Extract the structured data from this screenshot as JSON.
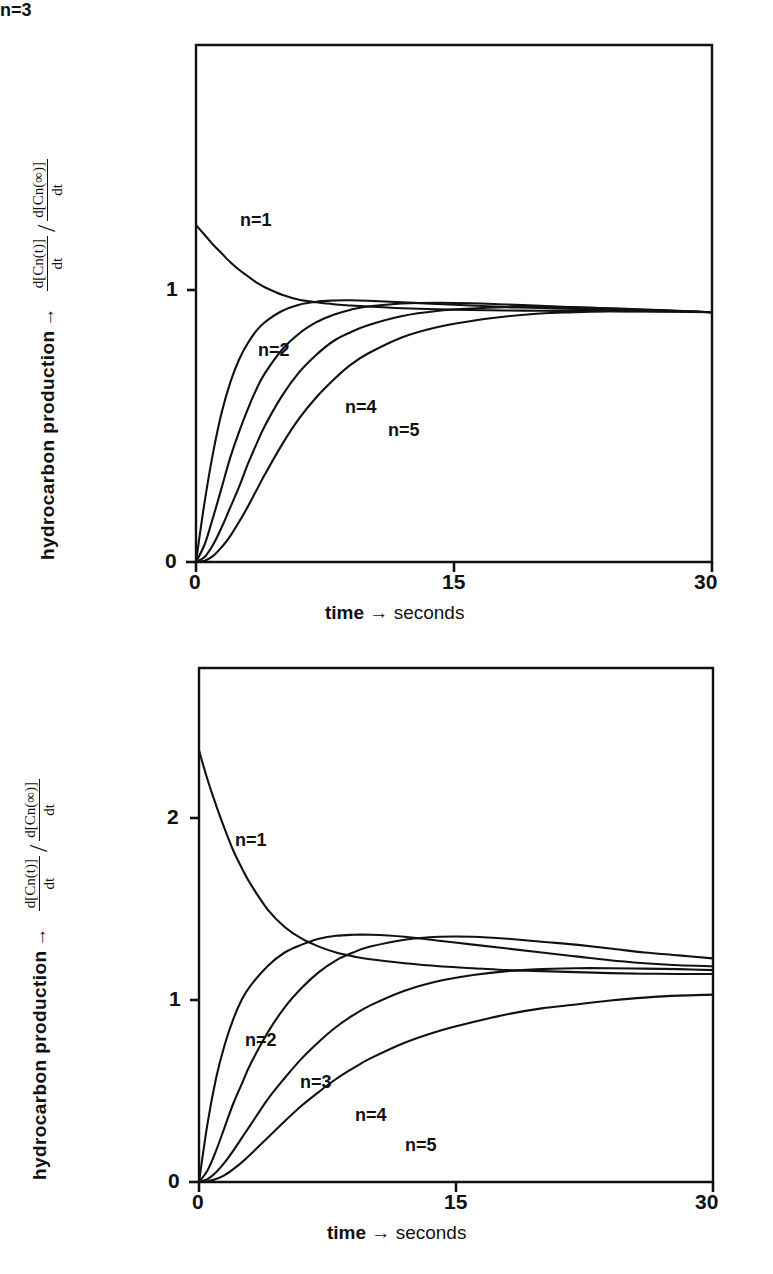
{
  "page": {
    "header_faint_text": "",
    "footer_faint_text": ""
  },
  "figures": [
    {
      "id": "top",
      "ylabel_main": "hydrocarbon production",
      "ylabel_arrow": "→",
      "ratio": {
        "numerator_top": "d[Cn(t)]",
        "numerator_bottom": "dt",
        "divider": "/",
        "denominator_top": "d[Cn(∞)]",
        "denominator_bottom": "dt"
      },
      "xlabel_bold": "time",
      "xlabel_arrow": "→",
      "xlabel_rest": "seconds",
      "yticks": [
        "0",
        "1"
      ],
      "xticks": [
        "0",
        "15",
        "30"
      ],
      "curve_labels": [
        "n=1",
        "n=2",
        "n=3",
        "n=4",
        "n=5"
      ]
    },
    {
      "id": "bottom",
      "ylabel_main": "hydrocarbon production",
      "ylabel_arrow": "→",
      "ratio": {
        "numerator_top": "d[Cn(t)]",
        "numerator_bottom": "dt",
        "divider": "/",
        "denominator_top": "d[Cn(∞)]",
        "denominator_bottom": "dt"
      },
      "xlabel_bold": "time",
      "xlabel_arrow": "→",
      "xlabel_rest": "seconds",
      "yticks": [
        "0",
        "1",
        "2"
      ],
      "xticks": [
        "0",
        "15",
        "30"
      ],
      "curve_labels": [
        "n=1",
        "n=2",
        "n=3",
        "n=4",
        "n=5"
      ]
    }
  ],
  "chart_data": [
    {
      "type": "line",
      "id": "top-chart",
      "title": "",
      "xlabel": "time → seconds",
      "ylabel": "hydrocarbon production →  d[Cn(t)]/dt / d[Cn(∞)]/dt",
      "xlim": [
        0,
        30
      ],
      "ylim": [
        0,
        2.07
      ],
      "xticks": [
        0,
        15,
        30
      ],
      "yticks": [
        0,
        1
      ],
      "grid": false,
      "legend": "inline-curve-labels",
      "x": [
        0,
        0.5,
        1,
        1.5,
        2,
        2.5,
        3,
        3.5,
        4,
        5,
        6,
        7,
        8,
        9,
        10,
        12,
        14,
        16,
        18,
        20,
        22,
        24,
        26,
        28,
        30
      ],
      "series": [
        {
          "name": "n=1",
          "label": "n=1",
          "values": [
            1.35,
            1.31,
            1.27,
            1.235,
            1.2,
            1.17,
            1.145,
            1.12,
            1.1,
            1.07,
            1.05,
            1.04,
            1.032,
            1.027,
            1.023,
            1.016,
            1.012,
            1.009,
            1.007,
            1.006,
            1.005,
            1.004,
            1.003,
            1.002,
            1.0
          ]
        },
        {
          "name": "n=2",
          "label": "n=2",
          "values": [
            0.0,
            0.24,
            0.44,
            0.6,
            0.72,
            0.81,
            0.875,
            0.925,
            0.96,
            1.005,
            1.03,
            1.042,
            1.047,
            1.048,
            1.046,
            1.04,
            1.033,
            1.027,
            1.021,
            1.017,
            1.013,
            1.01,
            1.007,
            1.004,
            1.0
          ]
        },
        {
          "name": "n=3",
          "label": "n=3",
          "values": [
            0.0,
            0.07,
            0.18,
            0.3,
            0.42,
            0.52,
            0.61,
            0.69,
            0.755,
            0.85,
            0.915,
            0.96,
            0.99,
            1.01,
            1.023,
            1.035,
            1.038,
            1.036,
            1.031,
            1.026,
            1.02,
            1.015,
            1.01,
            1.005,
            1.0
          ]
        },
        {
          "name": "n=4",
          "label": "n=4",
          "values": [
            0.0,
            0.02,
            0.07,
            0.14,
            0.22,
            0.3,
            0.39,
            0.47,
            0.545,
            0.665,
            0.76,
            0.83,
            0.885,
            0.92,
            0.948,
            0.985,
            1.005,
            1.015,
            1.02,
            1.021,
            1.02,
            1.016,
            1.011,
            1.006,
            1.0
          ]
        },
        {
          "name": "n=5",
          "label": "n=5",
          "values": [
            0.0,
            0.005,
            0.025,
            0.06,
            0.105,
            0.16,
            0.22,
            0.285,
            0.35,
            0.47,
            0.575,
            0.66,
            0.73,
            0.79,
            0.835,
            0.9,
            0.94,
            0.965,
            0.983,
            0.995,
            1.0,
            1.004,
            1.004,
            1.003,
            1.0
          ]
        }
      ]
    },
    {
      "type": "line",
      "id": "bottom-chart",
      "title": "",
      "xlabel": "time → seconds",
      "ylabel": "hydrocarbon production →  d[Cn(t)]/dt / d[Cn(∞)]/dt",
      "xlim": [
        0,
        30
      ],
      "ylim": [
        0,
        2.62
      ],
      "xticks": [
        0,
        15,
        30
      ],
      "yticks": [
        0,
        1,
        2
      ],
      "grid": false,
      "legend": "inline-curve-labels",
      "x": [
        0,
        0.5,
        1,
        1.5,
        2,
        2.5,
        3,
        4,
        5,
        6,
        7,
        8,
        9,
        10,
        12,
        14,
        16,
        18,
        20,
        22,
        24,
        26,
        28,
        30
      ],
      "series": [
        {
          "name": "n=1",
          "label": "n=1",
          "values": [
            2.2,
            2.05,
            1.92,
            1.8,
            1.69,
            1.6,
            1.52,
            1.39,
            1.3,
            1.24,
            1.2,
            1.17,
            1.15,
            1.135,
            1.115,
            1.1,
            1.09,
            1.08,
            1.075,
            1.07,
            1.065,
            1.062,
            1.06,
            1.06
          ]
        },
        {
          "name": "n=2",
          "label": "n=2",
          "values": [
            0.0,
            0.3,
            0.53,
            0.7,
            0.83,
            0.93,
            1.0,
            1.1,
            1.17,
            1.21,
            1.24,
            1.255,
            1.26,
            1.26,
            1.25,
            1.23,
            1.21,
            1.19,
            1.17,
            1.15,
            1.13,
            1.115,
            1.105,
            1.1
          ]
        },
        {
          "name": "n=3",
          "label": "n=3",
          "values": [
            0.0,
            0.06,
            0.16,
            0.28,
            0.4,
            0.5,
            0.6,
            0.76,
            0.89,
            0.99,
            1.07,
            1.13,
            1.17,
            1.2,
            1.235,
            1.25,
            1.25,
            1.24,
            1.225,
            1.21,
            1.19,
            1.17,
            1.155,
            1.14
          ]
        },
        {
          "name": "n=4",
          "label": "n=4",
          "values": [
            0.0,
            0.015,
            0.05,
            0.1,
            0.16,
            0.225,
            0.29,
            0.42,
            0.53,
            0.63,
            0.715,
            0.79,
            0.85,
            0.9,
            0.975,
            1.025,
            1.055,
            1.075,
            1.085,
            1.09,
            1.09,
            1.088,
            1.085,
            1.08
          ]
        },
        {
          "name": "n=5",
          "label": "n=5",
          "values": [
            0.0,
            0.004,
            0.015,
            0.035,
            0.065,
            0.1,
            0.14,
            0.225,
            0.31,
            0.39,
            0.46,
            0.525,
            0.58,
            0.63,
            0.71,
            0.77,
            0.815,
            0.855,
            0.885,
            0.905,
            0.925,
            0.94,
            0.95,
            0.955
          ]
        }
      ]
    }
  ]
}
